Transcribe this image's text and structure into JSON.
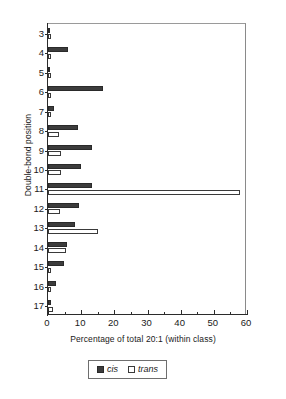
{
  "chart_data": {
    "type": "bar",
    "orientation": "horizontal",
    "title": "",
    "xlabel": "Percentage of total 20:1 (within class)",
    "ylabel": "Double-bond position",
    "xlim": [
      0,
      60
    ],
    "xticks": [
      0,
      10,
      20,
      30,
      40,
      50,
      60
    ],
    "xtick_labels": [
      "0",
      "10",
      "20",
      "30",
      "40",
      "50",
      "60"
    ],
    "x_minor_tick_step": 5,
    "grid": false,
    "categories": [
      3,
      4,
      5,
      6,
      7,
      8,
      9,
      10,
      11,
      12,
      13,
      14,
      15,
      16,
      17
    ],
    "category_labels": [
      "3",
      "4",
      "5",
      "6",
      "7",
      "8",
      "9",
      "10",
      "11",
      "12",
      "13",
      "14",
      "15",
      "16",
      "17"
    ],
    "series": [
      {
        "name": "cis",
        "color": "#3c3c3c",
        "fill": "solid",
        "values": [
          0.6,
          6.0,
          0.7,
          16.5,
          1.8,
          9.0,
          13.2,
          10.0,
          13.3,
          9.2,
          8.0,
          5.8,
          4.8,
          2.3,
          1.0
        ]
      },
      {
        "name": "trans",
        "color": "#ffffff",
        "fill": "open",
        "values": [
          0.3,
          0.2,
          0.8,
          0.5,
          0.3,
          3.4,
          4.0,
          4.0,
          58.0,
          3.6,
          15.0,
          5.3,
          0.8,
          0.3,
          1.6
        ]
      }
    ],
    "legend": {
      "position": "bottom-center",
      "entries": [
        {
          "label": "cis",
          "swatch": "cis-swatch"
        },
        {
          "label": "trans",
          "swatch": "trans-swatch"
        }
      ]
    },
    "axis_color": "#2b2b2b",
    "frame_color": "#8a8a8a"
  }
}
